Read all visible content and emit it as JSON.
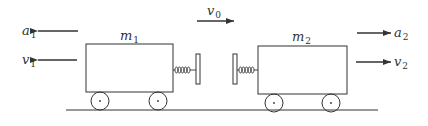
{
  "diagram": {
    "labels": {
      "a1": {
        "base": "a",
        "sub": "1"
      },
      "v1": {
        "base": "v",
        "sub": "1"
      },
      "m1": {
        "base": "m",
        "sub": "1"
      },
      "v0": {
        "base": "v",
        "sub": "0"
      },
      "m2": {
        "base": "m",
        "sub": "2"
      },
      "a2": {
        "base": "a",
        "sub": "2"
      },
      "v2": {
        "base": "v",
        "sub": "2"
      }
    },
    "colors": {
      "stroke": "#333333",
      "background": "#ffffff"
    }
  }
}
